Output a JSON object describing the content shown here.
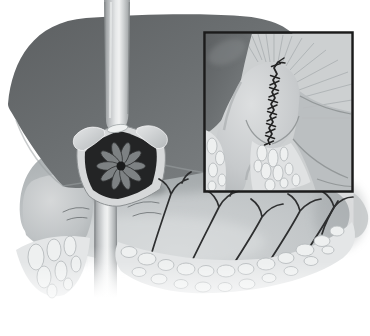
{
  "figure": {
    "kind": "surgical-anatomy-illustration",
    "view": "upper-abdomen-with-inset-detail"
  },
  "colors": {
    "background": "#ffffff",
    "liver": "#6a6e70",
    "liver_edge_highlight": "#9ba0a2",
    "esophagus": "#d9dbdc",
    "stomach": "#bfc3c5",
    "cavity_dark": "#232425",
    "mucosal_fold": "#7d8183",
    "cut_edge": "#d6d8d9",
    "vessel": "#2d2e2f",
    "wrinkle": "#6f7375",
    "fat_base": "#e4e6e7",
    "fat_fill": "#eef0f0",
    "fat_stroke": "#b7bbbd",
    "suture": "#242424",
    "inset_border": "#1b1b1b",
    "inset_bg": "#cdd0d1",
    "inset_mid": "#b9bdbf",
    "striation": "#a9aeb0",
    "fold_line": "#8f9395"
  },
  "semantics": {
    "main_parts": [
      "liver",
      "esophagus",
      "stomach",
      "gastric-opening-with-mucosal-rosette",
      "gastric-vessels",
      "omental-fat"
    ],
    "inset_parts": [
      "liver-edge",
      "diaphragm-striations",
      "sutured-closure",
      "omental-fat"
    ]
  }
}
